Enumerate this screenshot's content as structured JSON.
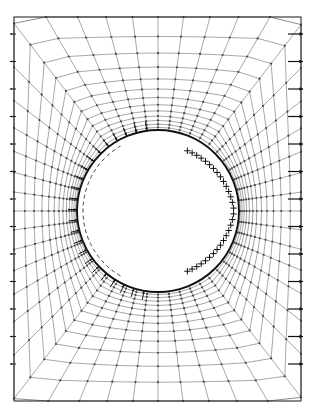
{
  "figure": {
    "type": "mesh-diagram",
    "canvas": {
      "width": 315,
      "height": 418,
      "background": "#ffffff"
    }
  },
  "colors": {
    "mesh_line": "#4a4a4a",
    "mesh_line_light": "#777777",
    "outer_border": "#2b2b2b",
    "hole_boundary": "#111111",
    "dashed_arc": "#444444",
    "arrow": "#111111",
    "plus_marker": "#111111"
  },
  "outer_boundary": {
    "name": "plate-outline",
    "shape": "rectangle",
    "x_min": 14,
    "y_min": 17,
    "x_max": 301,
    "y_max": 401,
    "width": 287,
    "height": 384,
    "stroke_width": 1.1
  },
  "hole": {
    "name": "circular-hole",
    "shape": "circle",
    "center_x": 158,
    "center_y": 211,
    "radius": 81,
    "stroke_width": 1.9
  },
  "dashed_arc": {
    "name": "deformed-hole-arc",
    "center_x": 158,
    "center_y": 211,
    "radius": 75,
    "start_angle_deg": 120,
    "end_angle_deg": 240,
    "dash_pattern": "4,3",
    "stroke_width": 1.0
  },
  "mesh": {
    "type": "polar-o-grid",
    "radial_divisions": 13,
    "circumferential_divisions": 48,
    "radial_grading": "geometric",
    "grading_ratio": 1.18,
    "node_marker": "dot",
    "node_marker_size": 1.1,
    "line_width": 0.65
  },
  "chart_data": {
    "type": "mesh",
    "radial_rings": [
      81,
      86,
      92,
      99,
      107,
      117,
      128,
      141,
      156,
      174,
      195,
      220,
      250
    ],
    "angular_count": 48,
    "hole_radius": 81,
    "plate_width": 287,
    "plate_height": 384
  },
  "load_arrows_right_edge": {
    "name": "traction-arrows-right-edge",
    "count": 13,
    "direction": "right",
    "x_tail": 288,
    "x_head": 303,
    "y_start": 34,
    "y_spacing": 27.5,
    "shaft_width": 1.2,
    "head_size": 4.0
  },
  "load_arrows_left_edge": {
    "name": "traction-arrows-left-edge",
    "count": 13,
    "direction": "left",
    "x_tail": 16,
    "x_head": 10,
    "y_start": 34,
    "y_spacing": 27.5,
    "shaft_width": 0.9,
    "head_size": 2.4
  },
  "hole_arrows": {
    "name": "hole-surface-arrows",
    "description": "Inward-pointing traction arrows on the left half of the hole boundary",
    "count": 23,
    "start_angle_deg": 100,
    "end_angle_deg": 262,
    "direction": "inward-horizontal-right",
    "length": 9,
    "head_size": 3.0
  },
  "hole_plus_markers": {
    "name": "hole-surface-plus-markers",
    "description": "Plus symbols distributed inside the right half of the hole boundary",
    "count": 30,
    "start_angle_deg": -64,
    "end_angle_deg": 64,
    "inset_min": 5,
    "inset_max": 15,
    "size": 3.2,
    "stroke_width": 1.0
  }
}
